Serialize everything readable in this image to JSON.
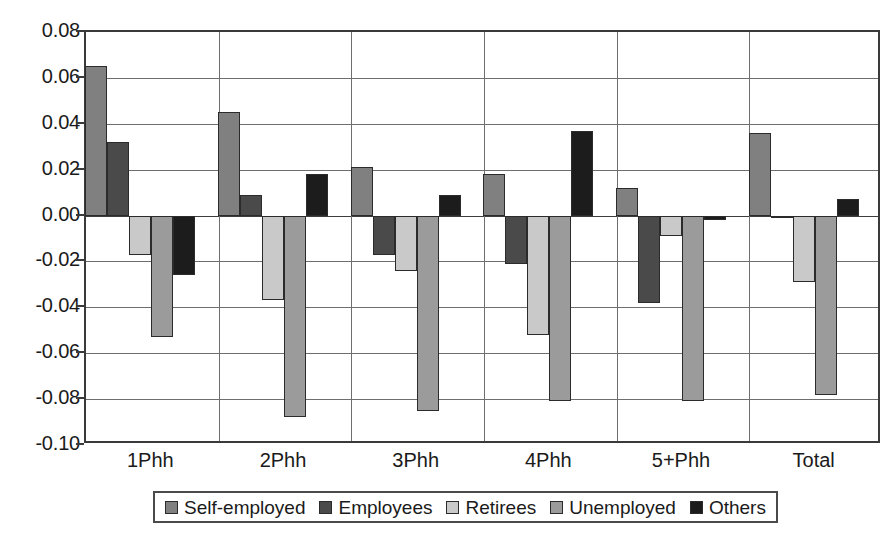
{
  "chart_data": {
    "type": "bar",
    "title": "",
    "subtitle": "",
    "xlabel": "",
    "ylabel": "",
    "grid": true,
    "legend_position": "bottom",
    "ylim": [
      -0.1,
      0.08
    ],
    "ytick_step": 0.02,
    "ytick_labels": [
      "0.08",
      "0.06",
      "0.04",
      "0.02",
      "0.00",
      "-0.02",
      "-0.04",
      "-0.06",
      "-0.08",
      "-0.10"
    ],
    "ytick_values": [
      0.08,
      0.06,
      0.04,
      0.02,
      0.0,
      -0.02,
      -0.04,
      -0.06,
      -0.08,
      -0.1
    ],
    "categories": [
      "1Phh",
      "2Phh",
      "3Phh",
      "4Phh",
      "5+Phh",
      "Total"
    ],
    "series": [
      {
        "name": "Self-employed",
        "color": "#808080",
        "values": [
          0.065,
          0.045,
          0.021,
          0.018,
          0.012,
          0.036
        ]
      },
      {
        "name": "Employees",
        "color": "#4a4a4a",
        "values": [
          0.032,
          0.009,
          -0.017,
          -0.021,
          -0.038,
          -0.001
        ]
      },
      {
        "name": "Retirees",
        "color": "#c9c9c9",
        "values": [
          -0.017,
          -0.037,
          -0.024,
          -0.052,
          -0.009,
          -0.029
        ]
      },
      {
        "name": "Unemployed",
        "color": "#9b9b9b",
        "values": [
          -0.053,
          -0.088,
          -0.085,
          -0.081,
          -0.081,
          -0.078
        ]
      },
      {
        "name": "Others",
        "color": "#1c1c1c",
        "values": [
          -0.026,
          0.018,
          0.009,
          0.037,
          -0.002,
          0.007
        ]
      }
    ]
  },
  "axis": {
    "bar_outline_color": "#2b2b2b",
    "grid_color": "#6e6e6e",
    "frame_color": "#3a3a3a"
  }
}
